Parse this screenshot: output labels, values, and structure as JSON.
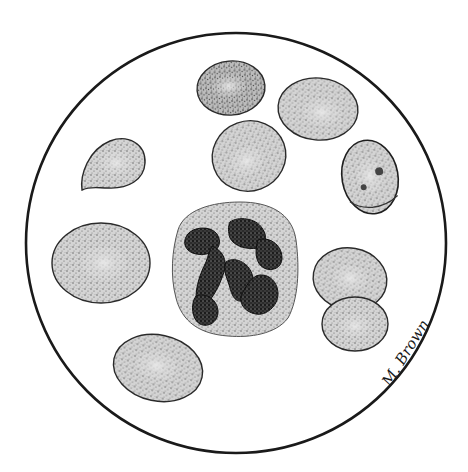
{
  "figure": {
    "subject": "Blood smear illustration showing erythrocytes and a neutrophil",
    "signature": "M. Brown",
    "colors": {
      "background": "#ffffff",
      "outline": "#1a1a1a",
      "cell_fill": "#c9c9c9",
      "cell_center": "#e2e2e2",
      "nucleus": "#2a2a2a"
    },
    "field_of_view": {
      "cx": 236,
      "cy": 243,
      "r": 210
    },
    "cells": [
      {
        "id": "rbc-top-center",
        "type": "erythrocyte",
        "cx": 231,
        "cy": 88,
        "rx": 34,
        "ry": 27,
        "rotate": -5
      },
      {
        "id": "rbc-top-right",
        "type": "erythrocyte",
        "cx": 318,
        "cy": 109,
        "rx": 40,
        "ry": 31,
        "rotate": 5
      },
      {
        "id": "rbc-middle",
        "type": "erythrocyte",
        "cx": 249,
        "cy": 156,
        "rx": 37,
        "ry": 35,
        "rotate": -20
      },
      {
        "id": "rbc-teardrop",
        "type": "teardrop-erythrocyte",
        "cx": 113,
        "cy": 163
      },
      {
        "id": "rbc-inclusion",
        "type": "erythrocyte-with-inclusions",
        "cx": 370,
        "cy": 177,
        "rx": 28,
        "ry": 37,
        "rotate": -10
      },
      {
        "id": "rbc-large-left",
        "type": "erythrocyte",
        "cx": 101,
        "cy": 263,
        "rx": 49,
        "ry": 40,
        "rotate": 0
      },
      {
        "id": "neutrophil",
        "type": "segmented-neutrophil",
        "cx": 235,
        "cy": 268,
        "rx": 62,
        "ry": 67
      },
      {
        "id": "rbc-pair-top",
        "type": "erythrocyte",
        "cx": 350,
        "cy": 279,
        "rx": 37,
        "ry": 31,
        "rotate": 10
      },
      {
        "id": "rbc-pair-bottom",
        "type": "erythrocyte",
        "cx": 355,
        "cy": 324,
        "rx": 33,
        "ry": 27,
        "rotate": 0
      },
      {
        "id": "rbc-bottom-left",
        "type": "erythrocyte",
        "cx": 158,
        "cy": 368,
        "rx": 45,
        "ry": 33,
        "rotate": 12
      }
    ]
  }
}
